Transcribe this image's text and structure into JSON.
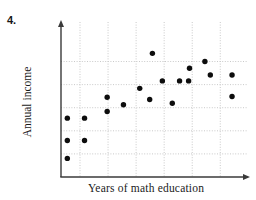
{
  "figure": {
    "number_label": "4.",
    "x_axis_label": "Years of math education",
    "y_axis_label": "Annual income"
  },
  "colors": {
    "point": "#0d0d0d",
    "axis": "#3a3a3a",
    "grid": "#c9c9c9",
    "text": "#1a1a1a",
    "background": "#ffffff"
  },
  "chart_data": {
    "type": "scatter",
    "title": "",
    "xlabel": "Years of math education",
    "ylabel": "Annual income",
    "grid": true,
    "legend": false,
    "axis_ticks_labeled": false,
    "x_axis_has_arrow": true,
    "y_axis_has_arrow": true,
    "xlim": [
      0,
      10
    ],
    "ylim": [
      0,
      10
    ],
    "points": [
      {
        "x": 0.35,
        "y": 3.95
      },
      {
        "x": 0.35,
        "y": 2.45
      },
      {
        "x": 0.35,
        "y": 1.25
      },
      {
        "x": 1.3,
        "y": 3.95
      },
      {
        "x": 1.3,
        "y": 2.45
      },
      {
        "x": 2.55,
        "y": 5.35
      },
      {
        "x": 2.55,
        "y": 4.4
      },
      {
        "x": 3.45,
        "y": 4.85
      },
      {
        "x": 4.35,
        "y": 5.95
      },
      {
        "x": 4.9,
        "y": 5.2
      },
      {
        "x": 5.05,
        "y": 8.3
      },
      {
        "x": 5.6,
        "y": 6.45
      },
      {
        "x": 6.15,
        "y": 4.95
      },
      {
        "x": 6.55,
        "y": 6.45
      },
      {
        "x": 7.05,
        "y": 6.45
      },
      {
        "x": 7.1,
        "y": 7.3
      },
      {
        "x": 7.95,
        "y": 7.75
      },
      {
        "x": 8.25,
        "y": 6.85
      },
      {
        "x": 9.45,
        "y": 6.85
      },
      {
        "x": 9.45,
        "y": 5.4
      }
    ],
    "gridlines": {
      "vertical_x": [
        1.05,
        2.6,
        4.15,
        5.7,
        7.25,
        8.8
      ],
      "horizontal_y": [
        1.55,
        3.1,
        4.65,
        6.2,
        7.75
      ]
    }
  }
}
